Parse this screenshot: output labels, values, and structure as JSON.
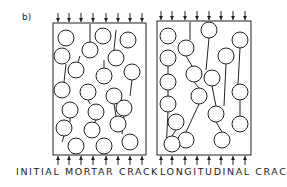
{
  "figure": {
    "sublabel": "b)",
    "ink_color": "#222222",
    "panels": [
      {
        "label": "INITIAL MORTAR CRACK",
        "box": {
          "x": 53,
          "y": 23,
          "w": 93,
          "h": 132
        },
        "arrows_x": [
          58,
          69,
          81,
          93,
          106,
          118,
          130,
          142
        ],
        "circles": [
          [
            66,
            38
          ],
          [
            103,
            36
          ],
          [
            128,
            40
          ],
          [
            62,
            56
          ],
          [
            90,
            50
          ],
          [
            116,
            58
          ],
          [
            76,
            70
          ],
          [
            104,
            76
          ],
          [
            132,
            72
          ],
          [
            62,
            90
          ],
          [
            88,
            92
          ],
          [
            114,
            96
          ],
          [
            70,
            110
          ],
          [
            96,
            112
          ],
          [
            124,
            108
          ],
          [
            64,
            128
          ],
          [
            92,
            130
          ],
          [
            118,
            124
          ],
          [
            76,
            146
          ],
          [
            104,
            146
          ],
          [
            130,
            142
          ]
        ],
        "cracks": [
          [
            [
              90,
              24
            ],
            [
              90,
              42
            ]
          ],
          [
            [
              116,
              30
            ],
            [
              114,
              50
            ]
          ],
          [
            [
              66,
              64
            ],
            [
              64,
              82
            ]
          ],
          [
            [
              80,
              56
            ],
            [
              78,
              62
            ]
          ],
          [
            [
              104,
              60
            ],
            [
              104,
              68
            ]
          ],
          [
            [
              132,
              80
            ],
            [
              130,
              96
            ]
          ],
          [
            [
              88,
              100
            ],
            [
              90,
              104
            ]
          ],
          [
            [
              70,
              118
            ],
            [
              70,
              122
            ]
          ],
          [
            [
              114,
              104
            ],
            [
              116,
              116
            ]
          ],
          [
            [
              64,
              136
            ],
            [
              62,
              142
            ]
          ],
          [
            [
              96,
              120
            ],
            [
              94,
              124
            ]
          ],
          [
            [
              124,
              116
            ],
            [
              122,
              134
            ]
          ],
          [
            [
              78,
              154
            ],
            [
              78,
              152
            ]
          ],
          [
            [
              104,
              154
            ],
            [
              106,
              138
            ]
          ]
        ]
      },
      {
        "label": "LONGITUDINAL CRACKS",
        "box": {
          "x": 157,
          "y": 21,
          "w": 94,
          "h": 134
        },
        "arrows_x": [
          161,
          172,
          185,
          197,
          209,
          221,
          233,
          245
        ],
        "circles": [
          [
            168,
            36
          ],
          [
            209,
            30
          ],
          [
            240,
            40
          ],
          [
            168,
            58
          ],
          [
            186,
            48
          ],
          [
            226,
            56
          ],
          [
            168,
            82
          ],
          [
            194,
            74
          ],
          [
            212,
            78
          ],
          [
            168,
            104
          ],
          [
            199,
            96
          ],
          [
            240,
            92
          ],
          [
            176,
            122
          ],
          [
            216,
            114
          ],
          [
            240,
            124
          ],
          [
            186,
            140
          ],
          [
            222,
            140
          ],
          [
            172,
            144
          ]
        ],
        "cracks": [
          [
            [
              190,
              22
            ],
            [
              190,
              40
            ]
          ],
          [
            [
              209,
              38
            ],
            [
              206,
              70
            ]
          ],
          [
            [
              240,
              48
            ],
            [
              238,
              84
            ]
          ],
          [
            [
              168,
              66
            ],
            [
              168,
              74
            ]
          ],
          [
            [
              186,
              56
            ],
            [
              192,
              66
            ]
          ],
          [
            [
              226,
              64
            ],
            [
              224,
              106
            ]
          ],
          [
            [
              194,
              82
            ],
            [
              199,
              88
            ]
          ],
          [
            [
              212,
              86
            ],
            [
              216,
              106
            ]
          ],
          [
            [
              168,
              90
            ],
            [
              168,
              96
            ]
          ],
          [
            [
              199,
              104
            ],
            [
              186,
              132
            ]
          ],
          [
            [
              240,
              100
            ],
            [
              240,
              116
            ]
          ],
          [
            [
              176,
              130
            ],
            [
              172,
              136
            ]
          ],
          [
            [
              216,
              122
            ],
            [
              222,
              132
            ]
          ],
          [
            [
              168,
              112
            ],
            [
              166,
              150
            ]
          ],
          [
            [
              232,
              60
            ],
            [
              232,
              50
            ]
          ]
        ]
      }
    ]
  }
}
